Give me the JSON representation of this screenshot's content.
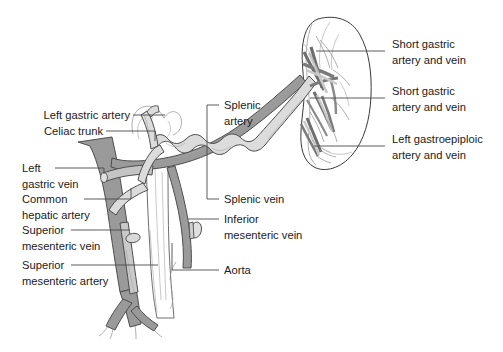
{
  "figure": {
    "kind": "anatomical-line-diagram",
    "width": 503,
    "height": 352,
    "background_color": "#ffffff",
    "palette": {
      "artery_fill": "#d9d9d9",
      "artery_stroke": "#4d4d4d",
      "vein_fill": "#9a9a9a",
      "vein_stroke": "#4d4d4d",
      "vein_dark_fill": "#8a8a8a",
      "aorta_fill": "#ffffff",
      "aorta_stroke": "#6e6e6e",
      "organ_stroke": "#3a3a3a",
      "organ_fill": "#ffffff",
      "leader_stroke": "#4a4a4a",
      "text_color": "#1a1a1a"
    }
  },
  "labels": {
    "left": [
      {
        "id": "left-gastric-artery",
        "lines": [
          "Left gastric artery"
        ]
      },
      {
        "id": "celiac-trunk",
        "lines": [
          "Celiac trunk"
        ]
      },
      {
        "id": "left-gastric-vein",
        "lines": [
          "Left",
          "gastric vein"
        ]
      },
      {
        "id": "common-hepatic-artery",
        "lines": [
          "Common",
          "hepatic artery"
        ]
      },
      {
        "id": "superior-mesenteric-vein",
        "lines": [
          "Superior",
          "mesenteric vein"
        ]
      },
      {
        "id": "superior-mesenteric-artery",
        "lines": [
          "Superior",
          "mesenteric artery"
        ]
      }
    ],
    "center": [
      {
        "id": "splenic-artery",
        "lines": [
          "Splenic",
          "artery"
        ]
      },
      {
        "id": "splenic-vein",
        "lines": [
          "Splenic vein"
        ]
      },
      {
        "id": "inferior-mesenteric-vein",
        "lines": [
          "Inferior",
          "mesenteric vein"
        ]
      },
      {
        "id": "aorta",
        "lines": [
          "Aorta"
        ]
      }
    ],
    "right": [
      {
        "id": "short-gastric-upper",
        "lines": [
          "Short gastric",
          "artery and vein"
        ]
      },
      {
        "id": "short-gastric-lower",
        "lines": [
          "Short gastric",
          "artery and vein"
        ]
      },
      {
        "id": "left-gastroepiploic",
        "lines": [
          "Left gastroepiploic",
          "artery and vein"
        ]
      }
    ]
  },
  "structures": [
    {
      "id": "spleen",
      "name": "spleen"
    },
    {
      "id": "stomach-outline",
      "name": "stomach-fundus-outline"
    },
    {
      "id": "aorta",
      "name": "abdominal-aorta"
    },
    {
      "id": "splenic-artery",
      "name": "splenic-artery"
    },
    {
      "id": "splenic-vein",
      "name": "splenic-vein"
    },
    {
      "id": "celiac-trunk",
      "name": "celiac-trunk"
    },
    {
      "id": "left-gastric-artery",
      "name": "left-gastric-artery"
    },
    {
      "id": "left-gastric-vein",
      "name": "left-gastric-vein"
    },
    {
      "id": "common-hepatic-artery",
      "name": "common-hepatic-artery"
    },
    {
      "id": "smv",
      "name": "superior-mesenteric-vein"
    },
    {
      "id": "sma",
      "name": "superior-mesenteric-artery"
    },
    {
      "id": "imv",
      "name": "inferior-mesenteric-vein"
    },
    {
      "id": "short-gastric",
      "name": "short-gastric-vessels"
    },
    {
      "id": "left-gastroepiploic",
      "name": "left-gastroepiploic-vessels"
    }
  ]
}
